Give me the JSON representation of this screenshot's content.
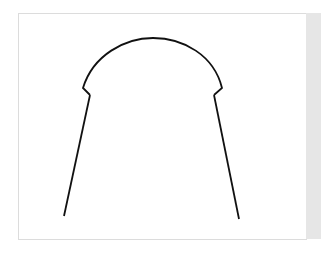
{
  "figure": {
    "stroke_color": "#111111",
    "background_color": "#ffffff",
    "frame_border_color": "#dcdcdc",
    "side_strip_color": "#e6e6e6"
  }
}
